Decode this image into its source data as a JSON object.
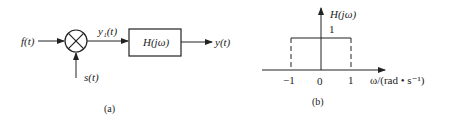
{
  "diagram_a": {
    "input_label": "f(t)",
    "multiplier_symbol": "⊗",
    "carrier_label": "s(t)",
    "intermediate_label": "y₁(t)",
    "filter_label": "H(jω)",
    "output_label": "y(t)",
    "caption": "(a)"
  },
  "diagram_b": {
    "y_axis_label": "H(jω)",
    "amplitude_label": "1",
    "x_ticks": [
      "−1",
      "0",
      "1"
    ],
    "x_axis_label": "ω/(rad • s⁻¹)",
    "caption": "(b)",
    "passband": {
      "from": -1,
      "to": 1,
      "gain": 1
    }
  }
}
